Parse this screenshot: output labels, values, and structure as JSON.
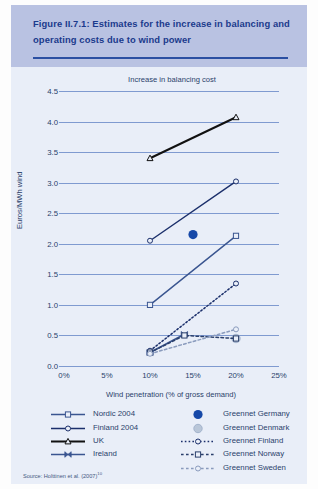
{
  "figure": {
    "title": "Figure II.7.1: Estimates for the increase in balancing and operating costs due to wind power",
    "source": "Source: Holttinen et al. (2007)",
    "source_superscript": "10"
  },
  "colors": {
    "banner_bg": "#b9c2e2",
    "banner_text": "#1b3a8c",
    "banner_rule": "#2b4fa2",
    "panel_bg": "#e9eef8",
    "gridline": "#7f9ad0",
    "axis_text": "#2a3f6b",
    "series_dark_navy": "#1b2f6b",
    "series_mid_blue": "#3a5590",
    "series_black": "#111111",
    "greennet_germany": "#1648a8",
    "greennet_denmark": "#b9c6d8"
  },
  "chart_data": {
    "type": "line",
    "title": "Increase in balancing cost",
    "xlabel": "Wind penetration (% of gross demand)",
    "ylabel": "Euros/MWh wind",
    "xlim": [
      0,
      25
    ],
    "ylim": [
      0.0,
      4.5
    ],
    "xticks": [
      "0%",
      "5%",
      "10%",
      "15%",
      "20%",
      "25%"
    ],
    "xtick_values": [
      0,
      5,
      10,
      15,
      20,
      25
    ],
    "yticks": [
      "0.0",
      "0.5",
      "1.0",
      "1.5",
      "2.0",
      "2.5",
      "3.0",
      "3.5",
      "4.0",
      "4.5"
    ],
    "ytick_values": [
      0.0,
      0.5,
      1.0,
      1.5,
      2.0,
      2.5,
      3.0,
      3.5,
      4.0,
      4.5
    ],
    "grid": "horizontal",
    "legend_position": "below-axes",
    "series": [
      {
        "name": "Nordic 2004",
        "marker": "square-open",
        "line": "solid",
        "color": "#3a5590",
        "points": [
          [
            10,
            1.0
          ],
          [
            20,
            2.13
          ]
        ]
      },
      {
        "name": "Finland 2004",
        "marker": "circle-open",
        "line": "solid",
        "color": "#1b2f6b",
        "points": [
          [
            10,
            2.05
          ],
          [
            20,
            3.02
          ]
        ]
      },
      {
        "name": "UK",
        "marker": "triangle-open",
        "line": "solid",
        "color": "#111111",
        "points": [
          [
            10,
            3.4
          ],
          [
            20,
            4.07
          ]
        ]
      },
      {
        "name": "Ireland",
        "marker": "bowtie",
        "line": "solid",
        "color": "#3a5590",
        "points": [
          [
            10,
            0.22
          ],
          [
            14,
            0.52
          ]
        ]
      },
      {
        "name": "Greennet Germany",
        "marker": "circle-filled",
        "line": "none",
        "color": "#1648a8",
        "points": [
          [
            15,
            2.15
          ]
        ]
      },
      {
        "name": "Greennet Denmark",
        "marker": "circle-filled-light",
        "line": "none",
        "color": "#b9c6d8",
        "points": [
          [
            20,
            0.45
          ]
        ]
      },
      {
        "name": "Greennet Finland",
        "marker": "circle-open",
        "line": "dotted",
        "color": "#1b2f6b",
        "points": [
          [
            10,
            0.25
          ],
          [
            20,
            1.35
          ]
        ]
      },
      {
        "name": "Greennet Norway",
        "marker": "square-open",
        "line": "dashed",
        "color": "#2a3f6b",
        "points": [
          [
            10,
            0.22
          ],
          [
            14,
            0.5
          ],
          [
            20,
            0.45
          ]
        ]
      },
      {
        "name": "Greennet Sweden",
        "marker": "circle-open",
        "line": "dashed",
        "color": "#8a9bbd",
        "points": [
          [
            10,
            0.2
          ],
          [
            20,
            0.6
          ]
        ]
      }
    ]
  },
  "legend": {
    "left_column": [
      "Nordic 2004",
      "Finland 2004",
      "UK",
      "Ireland"
    ],
    "right_column": [
      "Greennet Germany",
      "Greennet Denmark",
      "Greennet Finland",
      "Greennet Norway",
      "Greennet Sweden"
    ]
  }
}
